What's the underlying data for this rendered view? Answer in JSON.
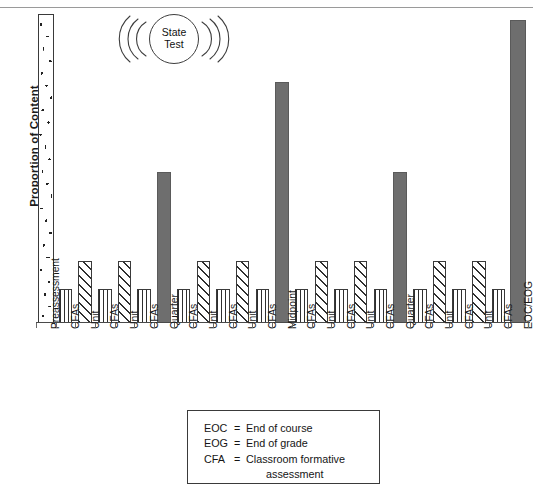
{
  "chart_data": {
    "type": "bar",
    "title": "",
    "xlabel": "",
    "ylabel": "Proportion of Content",
    "ylim": [
      0,
      100
    ],
    "grid": false,
    "legend_position": "bottom-center",
    "categories": [
      "Preassessment",
      "CFAs",
      "Unit",
      "CFAs",
      "Unit",
      "CFAs",
      "Quarter",
      "CFAs",
      "Unit",
      "CFAs",
      "Unit",
      "CFAs",
      "Midpoint",
      "CFAs",
      "Unit",
      "CFAs",
      "Unit",
      "CFAs",
      "Quarter",
      "CFAs",
      "Unit",
      "CFAs",
      "Unit",
      "CFAs",
      "EOC/EOG"
    ],
    "values": [
      100,
      11,
      20,
      11,
      20,
      11,
      49,
      11,
      20,
      11,
      20,
      11,
      78,
      11,
      20,
      11,
      20,
      11,
      49,
      11,
      20,
      11,
      20,
      11,
      98
    ],
    "fills": [
      "speckle",
      "vhatch",
      "dhatch",
      "vhatch",
      "dhatch",
      "vhatch",
      "solid",
      "vhatch",
      "dhatch",
      "vhatch",
      "dhatch",
      "vhatch",
      "solid",
      "vhatch",
      "dhatch",
      "vhatch",
      "dhatch",
      "vhatch",
      "solid",
      "vhatch",
      "dhatch",
      "vhatch",
      "dhatch",
      "vhatch",
      "solid"
    ],
    "series_types": {
      "preassessment": "Preassessment",
      "cfa": "CFAs",
      "unit": "Unit",
      "benchmark": "Quarter / Midpoint / EOC-EOG"
    },
    "colors": {
      "solid_bar": "#6e6e6e",
      "bar_outline": "#3a3a3a",
      "hatch": "#2f2f2f",
      "axis": "#4a4a4a",
      "text": "#1a1a1a"
    }
  },
  "annotation": {
    "state_test_line1": "State",
    "state_test_line2": "Test"
  },
  "legend": {
    "rows": [
      {
        "abbr": "EOC",
        "eq": "=",
        "def": "End of course"
      },
      {
        "abbr": "EOG",
        "eq": "=",
        "def": "End of grade"
      },
      {
        "abbr": "CFA",
        "eq": "=",
        "def": "Classroom formative"
      }
    ],
    "continuation": "assessment"
  }
}
